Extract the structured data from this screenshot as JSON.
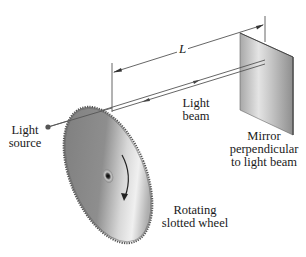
{
  "diagram": {
    "title": "",
    "labels": {
      "distance": "L",
      "beam_line1": "Light",
      "beam_line2": "beam",
      "source_line1": "Light",
      "source_line2": "source",
      "mirror_line1": "Mirror",
      "mirror_line2": "perpendicular",
      "mirror_line3": "to light beam",
      "wheel_line1": "Rotating",
      "wheel_line2": "slotted wheel"
    },
    "components": [
      {
        "id": "light-source",
        "type": "point source"
      },
      {
        "id": "rotating-slotted-wheel",
        "type": "toothed disc",
        "rotation": "clockwise"
      },
      {
        "id": "light-beam",
        "type": "two-way beam"
      },
      {
        "id": "mirror",
        "type": "plane mirror",
        "orientation": "perpendicular to light beam"
      },
      {
        "id": "distance-L",
        "type": "dimension",
        "between": [
          "wheel",
          "mirror"
        ]
      }
    ],
    "colors": {
      "line": "#555555",
      "wheel_dark": "#6e6e6e",
      "wheel_light": "#e0e0e0",
      "mirror_dark": "#9a9a9a",
      "mirror_light": "#e6e6e6",
      "text": "#1a1a1a"
    }
  }
}
